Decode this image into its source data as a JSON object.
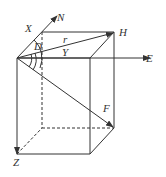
{
  "diagram": {
    "type": "3d-box-vector-diagram",
    "labels": {
      "X": "X",
      "N": "N",
      "D": "D",
      "r": "r",
      "Y": "Y",
      "H": "H",
      "E": "E",
      "F": "F",
      "Z": "Z"
    },
    "colors": {
      "line": "#333333",
      "background": "#ffffff"
    },
    "points": {
      "origin": [
        17,
        58
      ],
      "front_top_right": [
        90,
        58
      ],
      "front_bottom_left": [
        17,
        154
      ],
      "front_bottom_right": [
        90,
        154
      ],
      "back_top_left": [
        42,
        32
      ],
      "back_top_right_H": [
        114,
        32
      ],
      "back_bottom_left": [
        42,
        128
      ],
      "back_bottom_right_F": [
        114,
        128
      ],
      "N_tip": [
        57,
        16
      ],
      "E_tip": [
        150,
        58
      ]
    }
  }
}
